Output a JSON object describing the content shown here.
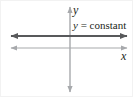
{
  "figure": {
    "name": "coordinate-plane-horizontal-line",
    "background_color": "#ffffff",
    "border_color": "#f2f2f2",
    "width": 133,
    "height": 97
  },
  "axes": {
    "color": "#a7a9ac",
    "origin": {
      "x": 69,
      "y": 47
    },
    "x_axis": {
      "name": "x-axis",
      "label": "x",
      "from_x": 10,
      "to_x": 126,
      "y": 47,
      "stroke_width": 1,
      "arrows": "both"
    },
    "y_axis": {
      "name": "y-axis",
      "label": "y",
      "x": 69,
      "from_y": 6,
      "to_y": 91,
      "stroke_width": 1,
      "arrows": "both"
    }
  },
  "graph": {
    "name": "constant-function-line",
    "equation_var": "y",
    "equation_op": "=",
    "equation_value": "constant",
    "equation_full": "y = constant",
    "color": "#58595b",
    "stroke_width": 2,
    "y": 35,
    "from_x": 10,
    "to_x": 126,
    "arrows": "both",
    "orientation": "horizontal",
    "position_relative_to_x_axis": "above"
  },
  "labels": {
    "y_axis_label": "y",
    "x_axis_label": "x",
    "line_label_var": "y",
    "line_label_op": "=",
    "line_label_word": "constant"
  },
  "colors": {
    "axis": "#a7a9ac",
    "line": "#58595b",
    "text": "#231f20",
    "background": "#ffffff"
  }
}
